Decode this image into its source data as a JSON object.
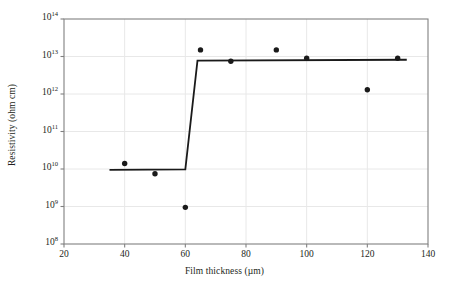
{
  "chart_data": {
    "type": "scatter",
    "title": "",
    "xlabel": "Film thickness (µm)",
    "ylabel": "Resistivity (ohm cm)",
    "xlim": [
      20,
      140
    ],
    "ylim": [
      100000000.0,
      100000000000000.0
    ],
    "yscale": "log",
    "xscale": "linear",
    "grid": true,
    "legend": null,
    "xticks": [
      20,
      40,
      60,
      80,
      100,
      120,
      140
    ],
    "xtick_labels": [
      "20",
      "40",
      "60",
      "80",
      "100",
      "120",
      "140"
    ],
    "yticks": [
      100000000.0,
      1000000000.0,
      10000000000.0,
      100000000000.0,
      1000000000000.0,
      10000000000000.0,
      100000000000000.0
    ],
    "ytick_labels": [
      "10^8",
      "10^9",
      "10^10",
      "10^11",
      "10^12",
      "10^13",
      "10^14"
    ],
    "ytick_mantissa": "10",
    "ytick_exponents": [
      "8",
      "9",
      "10",
      "11",
      "12",
      "13",
      "14"
    ],
    "marker_color": "#1a1a1a",
    "line_color": "#1a1a1a",
    "grid_color": "#e8e8e8",
    "axis_color": "#808080",
    "background_color": "#ffffff",
    "series": [
      {
        "name": "measured resistivity",
        "type": "scatter",
        "marker": "filled-circle",
        "points": [
          {
            "x": 40,
            "y": 14000000000.0
          },
          {
            "x": 50,
            "y": 7500000000.0
          },
          {
            "x": 60,
            "y": 950000000.0
          },
          {
            "x": 65,
            "y": 15000000000000.0
          },
          {
            "x": 75,
            "y": 7500000000000.0
          },
          {
            "x": 90,
            "y": 15000000000000.0
          },
          {
            "x": 100,
            "y": 9000000000000.0
          },
          {
            "x": 120,
            "y": 1300000000000.0
          },
          {
            "x": 130,
            "y": 9000000000000.0
          }
        ]
      },
      {
        "name": "step fit",
        "type": "line",
        "points": [
          {
            "x": 35,
            "y": 9500000000.0
          },
          {
            "x": 60,
            "y": 9800000000.0
          },
          {
            "x": 64,
            "y": 7800000000000.0
          },
          {
            "x": 133,
            "y": 8200000000000.0
          }
        ]
      }
    ]
  }
}
